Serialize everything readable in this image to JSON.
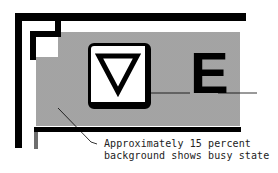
{
  "diagram": {
    "button": {
      "icon": "triangle-down-icon",
      "glyph": "▽"
    },
    "key_label": "E",
    "annotation": {
      "line1": "Approximately 15 percent",
      "line2": "background shows busy state"
    },
    "colors": {
      "frame": "#000000",
      "busy_background": "#c8c8c8",
      "page_background": "#ffffff"
    }
  }
}
